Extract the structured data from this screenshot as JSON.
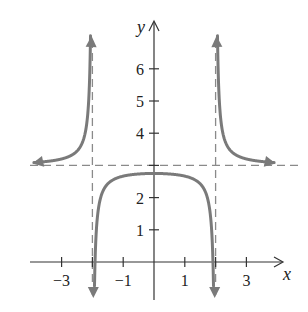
{
  "chart_data": {
    "type": "line",
    "title": "",
    "xlabel": "x",
    "ylabel": "y",
    "function": "y = 3 - 1/(4 - x^2)",
    "xlim": [
      -4,
      4.2
    ],
    "ylim": [
      -0.6,
      7.6
    ],
    "x_ticks": [
      {
        "value": -3,
        "label": "−3"
      },
      {
        "value": -2,
        "label": ""
      },
      {
        "value": -1,
        "label": "−1"
      },
      {
        "value": 1,
        "label": "1"
      },
      {
        "value": 2,
        "label": ""
      },
      {
        "value": 3,
        "label": "3"
      }
    ],
    "y_ticks": [
      {
        "value": 1,
        "label": "1"
      },
      {
        "value": 2,
        "label": "2"
      },
      {
        "value": 3,
        "label": ""
      },
      {
        "value": 4,
        "label": "4"
      },
      {
        "value": 5,
        "label": "5"
      },
      {
        "value": 6,
        "label": "6"
      }
    ],
    "asymptotes": {
      "vertical": [
        -2,
        2
      ],
      "horizontal": [
        3
      ]
    },
    "series": [
      {
        "name": "left branch",
        "domain": [
          -4,
          -2
        ],
        "behavior": "approaches y=3 as x→−∞, →+∞ as x→−2⁻"
      },
      {
        "name": "middle branch",
        "domain": [
          -2,
          2
        ],
        "behavior": "max y=2.75 at x=0, →−∞ at x→±2"
      },
      {
        "name": "right branch",
        "domain": [
          2,
          4
        ],
        "behavior": "→+∞ as x→2⁺, approaches y=3 as x→+∞"
      }
    ],
    "grid": false,
    "legend": null
  },
  "colors": {
    "curve": "#7a7a7a",
    "asymptote": "#8a8a8a",
    "axis": "#333333",
    "text": "#222222"
  }
}
